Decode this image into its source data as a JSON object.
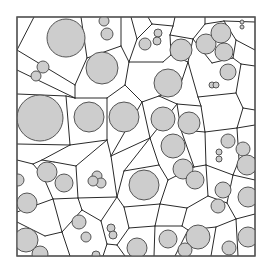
{
  "diagram": {
    "type": "power-diagram-with-disks",
    "colors": {
      "background": "#ffffff",
      "frame": "#555555",
      "edge": "#2a2a2a",
      "disk_fill": "#cdcdcd",
      "disk_stroke": "#555555"
    },
    "frame": {
      "x": 17,
      "y": 17,
      "w": 238,
      "h": 239
    },
    "circles": [
      {
        "cx": 66,
        "cy": 38,
        "r": 19
      },
      {
        "cx": 104,
        "cy": 21,
        "r": 5
      },
      {
        "cx": 107,
        "cy": 34,
        "r": 6
      },
      {
        "cx": 43,
        "cy": 67,
        "r": 6
      },
      {
        "cx": 36,
        "cy": 76,
        "r": 5
      },
      {
        "cx": 102,
        "cy": 68,
        "r": 16
      },
      {
        "cx": 145,
        "cy": 44,
        "r": 6
      },
      {
        "cx": 158,
        "cy": 33,
        "r": 4
      },
      {
        "cx": 157,
        "cy": 41,
        "r": 4
      },
      {
        "cx": 181,
        "cy": 50,
        "r": 11
      },
      {
        "cx": 206,
        "cy": 44,
        "r": 10
      },
      {
        "cx": 221,
        "cy": 33,
        "r": 10
      },
      {
        "cx": 224,
        "cy": 52,
        "r": 9
      },
      {
        "cx": 228,
        "cy": 72,
        "r": 8
      },
      {
        "cx": 242,
        "cy": 22,
        "r": 2
      },
      {
        "cx": 242,
        "cy": 27,
        "r": 2
      },
      {
        "cx": 40,
        "cy": 118,
        "r": 23
      },
      {
        "cx": 89,
        "cy": 117,
        "r": 15
      },
      {
        "cx": 124,
        "cy": 117,
        "r": 15
      },
      {
        "cx": 168,
        "cy": 83,
        "r": 14
      },
      {
        "cx": 212,
        "cy": 85,
        "r": 3
      },
      {
        "cx": 216,
        "cy": 85,
        "r": 3
      },
      {
        "cx": 163,
        "cy": 119,
        "r": 12
      },
      {
        "cx": 189,
        "cy": 123,
        "r": 11
      },
      {
        "cx": 173,
        "cy": 146,
        "r": 12
      },
      {
        "cx": 183,
        "cy": 169,
        "r": 10
      },
      {
        "cx": 228,
        "cy": 141,
        "r": 7
      },
      {
        "cx": 219,
        "cy": 152,
        "r": 3
      },
      {
        "cx": 219,
        "cy": 159,
        "r": 3
      },
      {
        "cx": 243,
        "cy": 149,
        "r": 7
      },
      {
        "cx": 247,
        "cy": 165,
        "r": 10
      },
      {
        "cx": 18,
        "cy": 180,
        "r": 6
      },
      {
        "cx": 47,
        "cy": 172,
        "r": 10
      },
      {
        "cx": 64,
        "cy": 183,
        "r": 9
      },
      {
        "cx": 27,
        "cy": 203,
        "r": 10
      },
      {
        "cx": 97,
        "cy": 176,
        "r": 5
      },
      {
        "cx": 101,
        "cy": 183,
        "r": 5
      },
      {
        "cx": 93,
        "cy": 181,
        "r": 5
      },
      {
        "cx": 144,
        "cy": 185,
        "r": 15
      },
      {
        "cx": 195,
        "cy": 180,
        "r": 9
      },
      {
        "cx": 223,
        "cy": 190,
        "r": 8
      },
      {
        "cx": 218,
        "cy": 206,
        "r": 7
      },
      {
        "cx": 248,
        "cy": 197,
        "r": 10
      },
      {
        "cx": 79,
        "cy": 222,
        "r": 7
      },
      {
        "cx": 86,
        "cy": 237,
        "r": 5
      },
      {
        "cx": 26,
        "cy": 240,
        "r": 12
      },
      {
        "cx": 40,
        "cy": 254,
        "r": 8
      },
      {
        "cx": 111,
        "cy": 228,
        "r": 4
      },
      {
        "cx": 113,
        "cy": 235,
        "r": 4
      },
      {
        "cx": 137,
        "cy": 248,
        "r": 10
      },
      {
        "cx": 168,
        "cy": 239,
        "r": 9
      },
      {
        "cx": 198,
        "cy": 237,
        "r": 12
      },
      {
        "cx": 185,
        "cy": 250,
        "r": 7
      },
      {
        "cx": 229,
        "cy": 248,
        "r": 7
      },
      {
        "cx": 248,
        "cy": 237,
        "r": 10
      },
      {
        "cx": 96,
        "cy": 255,
        "r": 4
      }
    ],
    "edges": [
      [
        34,
        17,
        17,
        50
      ],
      [
        17,
        50,
        75,
        85
      ],
      [
        75,
        85,
        87,
        58
      ],
      [
        87,
        58,
        81,
        17
      ],
      [
        87,
        58,
        121,
        46
      ],
      [
        121,
        46,
        121,
        17
      ],
      [
        121,
        46,
        129,
        62
      ],
      [
        129,
        62,
        137,
        39
      ],
      [
        137,
        39,
        131,
        17
      ],
      [
        137,
        39,
        152,
        24
      ],
      [
        152,
        24,
        148,
        17
      ],
      [
        152,
        24,
        173,
        26
      ],
      [
        173,
        26,
        175,
        17
      ],
      [
        173,
        26,
        170,
        35
      ],
      [
        170,
        35,
        171,
        55
      ],
      [
        171,
        55,
        163,
        62
      ],
      [
        163,
        62,
        129,
        62
      ],
      [
        129,
        62,
        125,
        85
      ],
      [
        125,
        85,
        142,
        102
      ],
      [
        142,
        102,
        159,
        96
      ],
      [
        159,
        96,
        178,
        92
      ],
      [
        178,
        92,
        188,
        62
      ],
      [
        188,
        62,
        171,
        55
      ],
      [
        188,
        62,
        193,
        39
      ],
      [
        193,
        39,
        170,
        35
      ],
      [
        193,
        39,
        205,
        24
      ],
      [
        205,
        24,
        205,
        17
      ],
      [
        205,
        24,
        224,
        21
      ],
      [
        224,
        21,
        255,
        22
      ],
      [
        224,
        21,
        236,
        40
      ],
      [
        236,
        40,
        255,
        50
      ],
      [
        236,
        40,
        233,
        58
      ],
      [
        233,
        58,
        212,
        63
      ],
      [
        212,
        63,
        193,
        39
      ],
      [
        233,
        58,
        241,
        64
      ],
      [
        241,
        64,
        255,
        66
      ],
      [
        241,
        64,
        236,
        93
      ],
      [
        236,
        93,
        198,
        97
      ],
      [
        198,
        97,
        188,
        62
      ],
      [
        17,
        70,
        75,
        98
      ],
      [
        75,
        98,
        75,
        85
      ],
      [
        75,
        98,
        107,
        98
      ],
      [
        107,
        98,
        125,
        85
      ],
      [
        17,
        94,
        66,
        96
      ],
      [
        66,
        96,
        75,
        98
      ],
      [
        66,
        96,
        70,
        145
      ],
      [
        70,
        145,
        107,
        140
      ],
      [
        107,
        140,
        107,
        98
      ],
      [
        17,
        144,
        70,
        145
      ],
      [
        107,
        140,
        111,
        156
      ],
      [
        111,
        156,
        142,
        102
      ],
      [
        142,
        102,
        150,
        138
      ],
      [
        150,
        138,
        111,
        156
      ],
      [
        150,
        138,
        177,
        104
      ],
      [
        177,
        104,
        159,
        96
      ],
      [
        177,
        104,
        201,
        106
      ],
      [
        201,
        106,
        198,
        97
      ],
      [
        201,
        106,
        205,
        132
      ],
      [
        205,
        132,
        181,
        130
      ],
      [
        181,
        130,
        177,
        104
      ],
      [
        236,
        93,
        243,
        108
      ],
      [
        243,
        108,
        255,
        110
      ],
      [
        243,
        108,
        237,
        128
      ],
      [
        237,
        128,
        205,
        132
      ],
      [
        237,
        128,
        255,
        125
      ],
      [
        237,
        128,
        239,
        160
      ],
      [
        239,
        160,
        255,
        158
      ],
      [
        239,
        160,
        233,
        175
      ],
      [
        205,
        132,
        206,
        165
      ],
      [
        206,
        165,
        233,
        175
      ],
      [
        206,
        165,
        194,
        167
      ],
      [
        194,
        167,
        181,
        130
      ],
      [
        17,
        160,
        33,
        164
      ],
      [
        33,
        164,
        43,
        176
      ],
      [
        43,
        176,
        53,
        199
      ],
      [
        53,
        199,
        17,
        212
      ],
      [
        33,
        164,
        42,
        160
      ],
      [
        42,
        160,
        70,
        145
      ],
      [
        42,
        160,
        54,
        162
      ],
      [
        54,
        162,
        76,
        166
      ],
      [
        76,
        166,
        107,
        140
      ],
      [
        76,
        166,
        78,
        198
      ],
      [
        78,
        198,
        53,
        199
      ],
      [
        78,
        198,
        117,
        197
      ],
      [
        117,
        197,
        111,
        156
      ],
      [
        117,
        197,
        124,
        171
      ],
      [
        124,
        171,
        150,
        138
      ],
      [
        124,
        171,
        159,
        165
      ],
      [
        159,
        165,
        150,
        138
      ],
      [
        159,
        165,
        168,
        180
      ],
      [
        168,
        180,
        194,
        167
      ],
      [
        168,
        180,
        160,
        204
      ],
      [
        160,
        204,
        124,
        207
      ],
      [
        124,
        207,
        117,
        197
      ],
      [
        124,
        207,
        129,
        228
      ],
      [
        129,
        228,
        117,
        245
      ],
      [
        117,
        245,
        107,
        244
      ],
      [
        107,
        244,
        101,
        221
      ],
      [
        101,
        221,
        117,
        197
      ],
      [
        101,
        221,
        82,
        210
      ],
      [
        82,
        210,
        78,
        198
      ],
      [
        82,
        210,
        62,
        232
      ],
      [
        62,
        232,
        53,
        199
      ],
      [
        62,
        232,
        70,
        256
      ],
      [
        62,
        232,
        45,
        236
      ],
      [
        45,
        236,
        17,
        222
      ],
      [
        107,
        244,
        103,
        256
      ],
      [
        117,
        245,
        125,
        256
      ],
      [
        129,
        228,
        155,
        226
      ],
      [
        155,
        226,
        160,
        204
      ],
      [
        155,
        226,
        154,
        256
      ],
      [
        160,
        204,
        187,
        208
      ],
      [
        187,
        208,
        182,
        226
      ],
      [
        182,
        226,
        155,
        226
      ],
      [
        182,
        226,
        188,
        230
      ],
      [
        187,
        208,
        208,
        196
      ],
      [
        208,
        196,
        206,
        165
      ],
      [
        208,
        196,
        227,
        203
      ],
      [
        227,
        203,
        233,
        175
      ],
      [
        227,
        203,
        236,
        219
      ],
      [
        236,
        219,
        255,
        214
      ],
      [
        236,
        219,
        216,
        227
      ],
      [
        216,
        227,
        211,
        256
      ],
      [
        216,
        227,
        188,
        230
      ],
      [
        188,
        230,
        175,
        256
      ],
      [
        233,
        175,
        255,
        180
      ],
      [
        236,
        219,
        238,
        256
      ]
    ]
  }
}
